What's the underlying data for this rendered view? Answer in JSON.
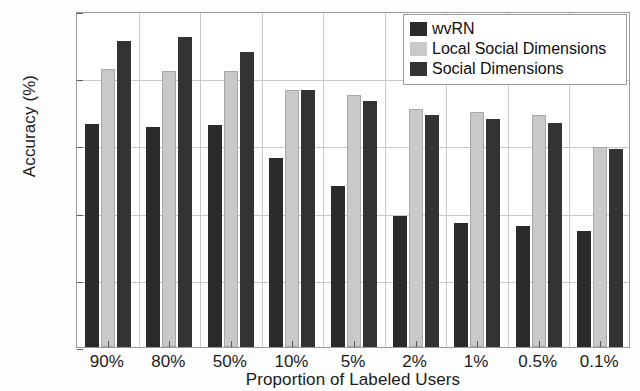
{
  "chart_data": {
    "type": "bar",
    "title": "",
    "xlabel": "Proportion of Labeled Users",
    "ylabel": "Accuracy (%)",
    "categories": [
      "90%",
      "80%",
      "50%",
      "10%",
      "5%",
      "2%",
      "1%",
      "0.5%",
      "0.1%"
    ],
    "series": [
      {
        "name": "wvRN",
        "color": "#2b2b2b",
        "values": [
          33.2,
          32.7,
          33.0,
          28.2,
          24.0,
          19.5,
          18.5,
          18.0,
          17.2
        ]
      },
      {
        "name": "Local Social Dimensions",
        "color": "#c9c9c9",
        "values": [
          41.4,
          41.0,
          41.1,
          38.2,
          37.5,
          35.4,
          35.0,
          34.5,
          29.7
        ]
      },
      {
        "name": "Social Dimensions",
        "color": "#333333",
        "values": [
          45.6,
          46.1,
          43.9,
          38.2,
          36.6,
          34.6,
          33.9,
          33.4,
          29.4
        ]
      }
    ],
    "ylim": [
      0,
      50
    ],
    "yticks": [
      0,
      10,
      20,
      30,
      40,
      50
    ],
    "ytick_labels": [
      "0",
      "10",
      "20",
      "30",
      "40",
      "50"
    ],
    "grid": true,
    "legend_position": "top-right"
  },
  "axes": {
    "y_title": "Accuracy (%)",
    "x_title": "Proportion of Labeled Users"
  },
  "legend": {
    "entries": [
      {
        "label": "wvRN",
        "color": "#2b2b2b"
      },
      {
        "label": "Local Social Dimensions",
        "color": "#c9c9c9"
      },
      {
        "label": "Social Dimensions",
        "color": "#333333"
      }
    ]
  }
}
